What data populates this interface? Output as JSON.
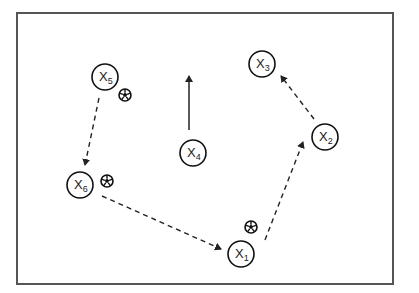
{
  "diagram": {
    "type": "soccer-drill",
    "field": {
      "x": 17,
      "y": 13,
      "width": 376,
      "height": 271,
      "border_color": "#555555"
    },
    "players": [
      {
        "id": "X1",
        "letter": "X",
        "number": "1",
        "cx": 241,
        "cy": 254
      },
      {
        "id": "X2",
        "letter": "X",
        "number": "2",
        "cx": 325,
        "cy": 137
      },
      {
        "id": "X3",
        "letter": "X",
        "number": "3",
        "cx": 262,
        "cy": 64
      },
      {
        "id": "X4",
        "letter": "X",
        "number": "4",
        "cx": 193,
        "cy": 153
      },
      {
        "id": "X5",
        "letter": "X",
        "number": "5",
        "cx": 105,
        "cy": 77
      },
      {
        "id": "X6",
        "letter": "X",
        "number": "6",
        "cx": 80,
        "cy": 185
      }
    ],
    "balls": [
      {
        "near": "X5",
        "cx": 125,
        "cy": 95
      },
      {
        "near": "X6",
        "cx": 107,
        "cy": 181
      },
      {
        "near": "X1",
        "cx": 251,
        "cy": 227
      }
    ],
    "movements": [
      {
        "from": "X5",
        "to": "X6",
        "style": "dashed",
        "x1": 99,
        "y1": 98,
        "x2": 85,
        "y2": 165
      },
      {
        "from": "X6",
        "to": "X1",
        "style": "dashed",
        "x1": 102,
        "y1": 196,
        "x2": 221,
        "y2": 249
      },
      {
        "from": "X1",
        "to": "X2",
        "style": "dashed",
        "x1": 265,
        "y1": 240,
        "x2": 303,
        "y2": 142
      },
      {
        "from": "X2",
        "to": "X3",
        "style": "dashed",
        "x1": 314,
        "y1": 119,
        "x2": 281,
        "y2": 76
      },
      {
        "from": "X4",
        "to": "forward",
        "style": "solid",
        "x1": 189,
        "y1": 130,
        "x2": 189,
        "y2": 76
      }
    ]
  }
}
